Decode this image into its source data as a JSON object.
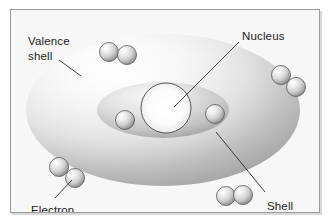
{
  "figure": {
    "frame": {
      "border_color": "#9a9a9a",
      "shadow_color": "#d8d8d8",
      "background_color": "#f7f7f7"
    }
  },
  "palette": {
    "background": "#f7f7f7",
    "outer_shell_light": "#f2f2f2",
    "outer_shell_mid": "#d6d6d6",
    "outer_shell_dark": "#a9a9a9",
    "inner_shell_light": "#efefef",
    "inner_shell_mid": "#d2d2d2",
    "inner_shell_dark": "#a6a6a6",
    "nucleus_center": "#ffffff",
    "nucleus_edge": "#e4e4e4",
    "nucleus_outline": "#4a4a4a",
    "electron_highlight": "#ffffff",
    "electron_mid": "#d0d0d0",
    "electron_shadow": "#8d8d8d",
    "electron_outline": "#595959",
    "leader_line": "#2b2b2b",
    "label_text": "#1c1c1c"
  },
  "labels": [
    {
      "id": "valence-shell",
      "lines": [
        "Valence",
        "shell"
      ],
      "line1": "Valence",
      "line2": "shell",
      "position": "top-left",
      "has_leader_line": true
    },
    {
      "id": "nucleus",
      "lines": [
        "Nucleus"
      ],
      "line1": "Nucleus",
      "position": "top-right",
      "has_leader_line": true
    },
    {
      "id": "electron",
      "lines": [
        "Electron"
      ],
      "line1": "Electron",
      "position": "bottom-left",
      "has_leader_line": true
    },
    {
      "id": "shell",
      "lines": [
        "Shell"
      ],
      "line1": "Shell",
      "position": "bottom-right",
      "has_leader_line": true
    }
  ],
  "structure": {
    "outer_shell": {
      "name": "Valence shell",
      "shape": "ellipse",
      "cx": 152,
      "cy": 100,
      "rx": 137,
      "ry": 76
    },
    "inner_shell": {
      "name": "Shell",
      "shape": "ellipse",
      "cx": 152,
      "cy": 100,
      "rx": 66,
      "ry": 28
    },
    "nucleus": {
      "name": "Nucleus",
      "shape": "circle",
      "cx": 155,
      "cy": 98,
      "r": 25
    },
    "electron_count": 10,
    "electron_radius": 9.5,
    "electrons": [
      {
        "id": "electron-top-left-a",
        "cx": 98,
        "cy": 42,
        "group": "valence-top"
      },
      {
        "id": "electron-top-left-b",
        "cx": 116,
        "cy": 45,
        "group": "valence-top"
      },
      {
        "id": "electron-right-upper-a",
        "cx": 270,
        "cy": 65,
        "group": "valence-right"
      },
      {
        "id": "electron-right-upper-b",
        "cx": 285,
        "cy": 77,
        "group": "valence-right"
      },
      {
        "id": "electron-bottom-left-a",
        "cx": 48,
        "cy": 157,
        "group": "valence-bottom-left"
      },
      {
        "id": "electron-bottom-left-b",
        "cx": 64,
        "cy": 168,
        "group": "valence-bottom-left"
      },
      {
        "id": "electron-bottom-right-a",
        "cx": 215,
        "cy": 186,
        "group": "valence-bottom-right"
      },
      {
        "id": "electron-bottom-right-b",
        "cx": 232,
        "cy": 185,
        "group": "valence-bottom-right"
      },
      {
        "id": "electron-inner-left",
        "cx": 114,
        "cy": 110,
        "group": "inner-shell"
      },
      {
        "id": "electron-inner-right",
        "cx": 204,
        "cy": 104,
        "group": "inner-shell"
      }
    ],
    "leader_lines": [
      {
        "id": "leader-valence-shell",
        "x1": 48,
        "y1": 50,
        "x2": 70,
        "y2": 66
      },
      {
        "id": "leader-nucleus",
        "x1": 228,
        "y1": 32,
        "x2": 163,
        "y2": 97
      },
      {
        "id": "leader-electron",
        "x1": 44,
        "y1": 188,
        "x2": 61,
        "y2": 170
      },
      {
        "id": "leader-shell",
        "x1": 205,
        "y1": 122,
        "x2": 254,
        "y2": 182
      }
    ]
  },
  "label_text_positions": {
    "valence_shell_line1": {
      "x": 17,
      "y": 35
    },
    "valence_shell_line2": {
      "x": 17,
      "y": 50
    },
    "nucleus": {
      "x": 231,
      "y": 30
    },
    "electron": {
      "x": 20,
      "y": 204
    },
    "shell": {
      "x": 256,
      "y": 200
    }
  }
}
